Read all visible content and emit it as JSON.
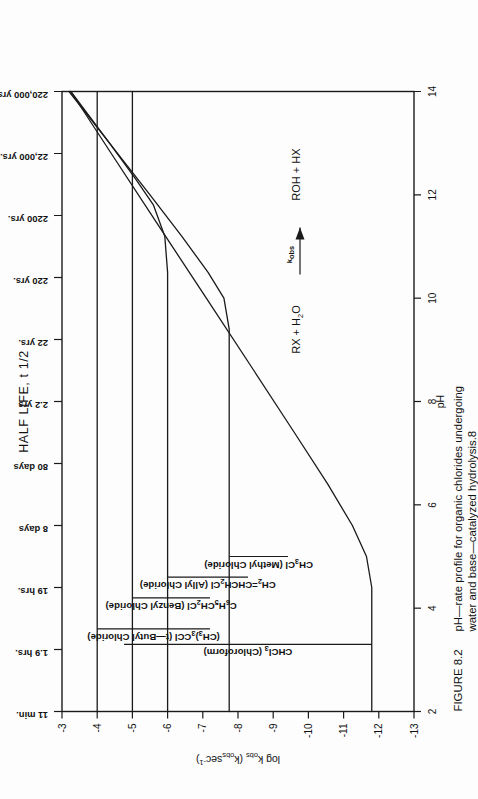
{
  "figure": {
    "top_axis_title": "HALF LIFE, t 1/2",
    "x_axis_label": "pH",
    "y_axis_label": "log k obs (kobssec-1)",
    "y_axis_label_parts": {
      "lead": "log k",
      "lead_sub": "obs",
      "paren_open": " (k",
      "paren_sub": "obs",
      "tail": "sec",
      "tail_sup": "-1",
      "paren_close": ")"
    },
    "caption_tag": "FIGURE 8.2",
    "caption_line1": "pH—rate profile for organic chlorides undergoing",
    "caption_line2": "water and base—catalyzed hydrolysis.8",
    "reaction": {
      "left": "RX + H",
      "left_sub": "2",
      "left_tail": "O",
      "rate_label": "k",
      "rate_label_sub": "obs",
      "right": "ROH + HX"
    },
    "colors": {
      "ink": "#1a1a1a",
      "paper": "#fdfdfd"
    }
  },
  "chart_data": {
    "type": "line",
    "title": "HALF LIFE, t 1/2",
    "xlabel": "pH",
    "ylabel": "log k obs (kobssec-1)",
    "xlim": [
      2,
      14
    ],
    "ylim": [
      -13,
      -3
    ],
    "grid": false,
    "legend": "inline-labels",
    "x_ticks": [
      2,
      4,
      6,
      8,
      10,
      12,
      14
    ],
    "x_tick_labels": [
      "2",
      "4",
      "6",
      "8",
      "10",
      "12",
      "14"
    ],
    "y_ticks": [
      -13,
      -12,
      -11,
      -10,
      -9,
      -8,
      -7,
      -6,
      -5,
      -4,
      -3
    ],
    "y_tick_labels": [
      "-13",
      "-12",
      "-11",
      "-10",
      "-9",
      "-8",
      "-7",
      "-6",
      "-5",
      "-4",
      "-3"
    ],
    "secondary_axis": {
      "name": "half_life",
      "position": "top",
      "values": [
        -3,
        -4,
        -5,
        -6,
        -7,
        -8,
        -9,
        -10,
        -11,
        -12,
        -13
      ],
      "labels": [
        "11 min.",
        "1.9 hrs.",
        "19 hrs.",
        "8 days",
        "80 days",
        "2.2 yrs",
        "22 yrs.",
        "220 yrs.",
        "2200 yrs.",
        "22,000 yrs.",
        "220,000 yrs."
      ]
    },
    "series": [
      {
        "name": "(CH3)3CCl (t-Butyl Chloride)",
        "label": "(CH",
        "label_parts": [
          "(CH",
          "3",
          ")",
          "3",
          "CCl  (t—Butyl Chloride)"
        ],
        "plateau_y": -4.0,
        "label_anchor_pH": 3.6,
        "leader_from_pH": 3.6,
        "points": [
          [
            2.0,
            -4.0
          ],
          [
            14.0,
            -4.0
          ]
        ]
      },
      {
        "name": "C6H5CH2Cl (Benzyl Chloride)",
        "label_parts": [
          "C",
          "6",
          "H",
          "5",
          "CH",
          "2",
          "Cl  (Benzyl Chloride)"
        ],
        "plateau_y": -5.0,
        "label_anchor_pH": 4.2,
        "leader_from_pH": 4.2,
        "points": [
          [
            2.0,
            -5.0
          ],
          [
            14.0,
            -5.0
          ]
        ]
      },
      {
        "name": "CH2=CHCH2Cl (Allyl Chloride)",
        "label_parts": [
          "CH",
          "2",
          "=CHCH",
          "2",
          "Cl  (Allyl Chloride)"
        ],
        "plateau_y": -6.0,
        "bend_pH": 11.6,
        "end_y": -3.05,
        "label_anchor_pH": 4.6,
        "leader_from_pH": 4.6,
        "points": [
          [
            2.0,
            -6.0
          ],
          [
            10.5,
            -6.0
          ],
          [
            11.2,
            -5.92
          ],
          [
            11.8,
            -5.6
          ],
          [
            12.3,
            -5.1
          ],
          [
            13.0,
            -4.35
          ],
          [
            14.0,
            -3.25
          ]
        ]
      },
      {
        "name": "CH3Cl (Methyl Chloride)",
        "label_parts": [
          "CH",
          "3",
          "Cl  (Methyl Chloride)"
        ],
        "plateau_y": -7.75,
        "bend_pH": 10.1,
        "end_y": -3.0,
        "label_anchor_pH": 5.0,
        "leader_from_pH": 5.0,
        "points": [
          [
            2.0,
            -7.75
          ],
          [
            9.4,
            -7.75
          ],
          [
            10.0,
            -7.6
          ],
          [
            10.5,
            -7.15
          ],
          [
            11.2,
            -6.4
          ],
          [
            12.0,
            -5.5
          ],
          [
            13.0,
            -4.35
          ],
          [
            14.0,
            -3.2
          ]
        ]
      },
      {
        "name": "CHCl3 (Chloroform)",
        "label_parts": [
          "CHCl",
          "3",
          "  (Chloroform)"
        ],
        "plateau_y": -11.8,
        "bend_pH": 5.1,
        "end_y": -3.0,
        "label_anchor_pH": 3.3,
        "leader_from_pH": 3.3,
        "points": [
          [
            2.0,
            -11.8
          ],
          [
            4.4,
            -11.8
          ],
          [
            5.0,
            -11.65
          ],
          [
            5.6,
            -11.25
          ],
          [
            6.4,
            -10.55
          ],
          [
            7.4,
            -9.6
          ],
          [
            8.6,
            -8.45
          ],
          [
            10.0,
            -7.1
          ],
          [
            11.5,
            -5.65
          ],
          [
            12.8,
            -4.4
          ],
          [
            14.0,
            -3.25
          ]
        ]
      }
    ]
  }
}
